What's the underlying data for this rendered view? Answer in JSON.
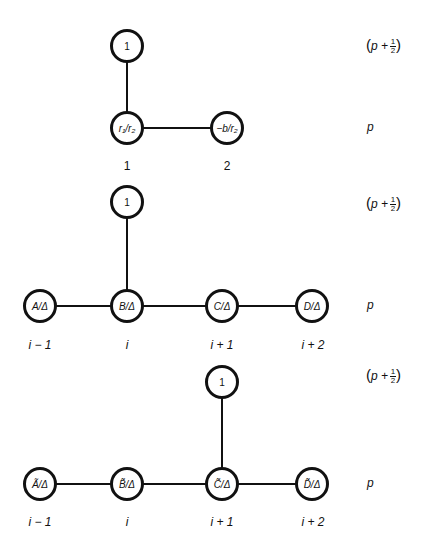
{
  "diagrams": [
    {
      "id": "top",
      "nodes": {
        "top": "1",
        "n1": "r₁/r₂",
        "n2": "−b/r₂"
      },
      "index_labels": [
        "1",
        "2"
      ],
      "side_labels": {
        "upper": {
          "base": "p +",
          "num": "1",
          "den": "2"
        },
        "lower": "p"
      }
    },
    {
      "id": "middle",
      "nodes": {
        "top": "1",
        "a": "A/Δ",
        "b": "B/Δ",
        "c": "C/Δ",
        "d": "D/Δ"
      },
      "index_labels": [
        "i − 1",
        "i",
        "i + 1",
        "i + 2"
      ],
      "side_labels": {
        "upper": {
          "base": "p +",
          "num": "1",
          "den": "2"
        },
        "lower": "p"
      }
    },
    {
      "id": "bottom",
      "nodes": {
        "top": "1",
        "a": "Ã/Δ",
        "b": "B̃/Δ",
        "c": "C̃/Δ",
        "d": "D̃/Δ"
      },
      "index_labels": [
        "i − 1",
        "i",
        "i + 1",
        "i + 2"
      ],
      "side_labels": {
        "upper": {
          "base": "p +",
          "num": "1",
          "den": "2"
        },
        "lower": "p"
      }
    }
  ],
  "colors": {
    "stroke": "#111111",
    "background": "#ffffff"
  }
}
